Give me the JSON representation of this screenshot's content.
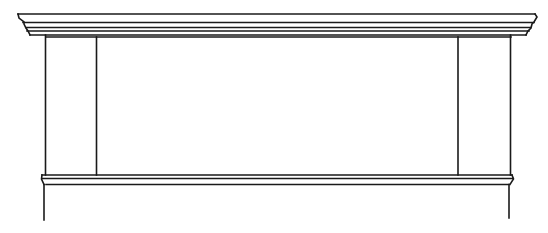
{
  "figure": {
    "stroke_color": "#1a1a1a",
    "background_color": "#ffffff"
  }
}
